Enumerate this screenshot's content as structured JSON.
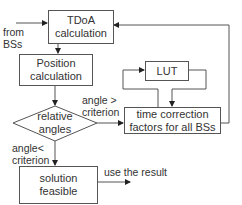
{
  "nodes": {
    "tdoa": {
      "line1": "TDoA",
      "line2": "calculation"
    },
    "position": {
      "line1": "Position",
      "line2": "calculation"
    },
    "lut": {
      "label": "LUT"
    },
    "decision": {
      "line1": "relative",
      "line2": "angles"
    },
    "time_correction": {
      "line1": "time correction",
      "line2": "factors for all BSs"
    },
    "solution": {
      "line1": "solution",
      "line2": "feasible"
    }
  },
  "edge_labels": {
    "input": {
      "line1": "from",
      "line2": "BSs"
    },
    "angle_gt": {
      "line1": "angle >",
      "line2": "criterion"
    },
    "angle_lt": {
      "line1": "angle<",
      "line2": "criterion"
    },
    "output": "use the result"
  },
  "colors": {
    "stroke": "#555555",
    "text": "#333333",
    "background": "#ffffff"
  }
}
